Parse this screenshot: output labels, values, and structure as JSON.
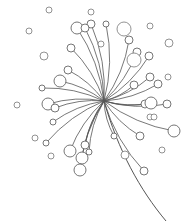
{
  "illustration": {
    "title": "Dandelion seed head line drawing",
    "stroke_color": "#555555",
    "background": "#ffffff",
    "center": [
      104,
      101
    ],
    "stem": {
      "path": "M104,101 C118,150 140,190 166,221"
    },
    "seeds": [
      [
        104,
        101,
        91,
        24,
        4
      ],
      [
        104,
        101,
        77,
        28,
        6
      ],
      [
        104,
        101,
        85,
        28,
        4
      ],
      [
        104,
        101,
        71,
        48,
        4
      ],
      [
        104,
        101,
        68,
        70,
        4
      ],
      [
        104,
        101,
        60,
        81,
        6
      ],
      [
        104,
        101,
        42,
        88,
        3
      ],
      [
        104,
        101,
        48,
        104,
        6
      ],
      [
        104,
        101,
        55,
        108,
        4
      ],
      [
        104,
        101,
        53,
        122,
        3
      ],
      [
        104,
        101,
        46,
        143,
        3
      ],
      [
        104,
        101,
        70,
        151,
        6
      ],
      [
        104,
        101,
        85,
        145,
        4
      ],
      [
        104,
        101,
        82,
        158,
        6
      ],
      [
        104,
        101,
        89,
        152,
        3
      ],
      [
        104,
        101,
        80,
        170,
        6
      ],
      [
        104,
        101,
        106,
        24,
        3
      ],
      [
        104,
        101,
        129,
        40,
        4
      ],
      [
        104,
        101,
        137,
        52,
        4
      ],
      [
        104,
        101,
        149,
        56,
        4
      ],
      [
        104,
        101,
        150,
        77,
        4
      ],
      [
        104,
        101,
        134,
        85,
        4
      ],
      [
        104,
        101,
        158,
        84,
        4
      ],
      [
        104,
        101,
        145,
        104,
        4
      ],
      [
        104,
        101,
        167,
        104,
        4
      ],
      [
        104,
        101,
        151,
        103,
        6
      ],
      [
        104,
        101,
        174,
        131,
        6
      ],
      [
        104,
        101,
        114,
        136,
        3
      ],
      [
        104,
        101,
        140,
        136,
        4
      ],
      [
        104,
        101,
        144,
        171,
        4
      ]
    ],
    "loose_dots": [
      [
        49,
        10,
        3
      ],
      [
        91,
        12,
        3
      ],
      [
        29,
        31,
        3
      ],
      [
        44,
        56,
        4
      ],
      [
        150,
        26,
        3
      ],
      [
        101,
        44,
        3
      ],
      [
        169,
        43,
        4
      ],
      [
        168,
        77,
        3
      ],
      [
        17,
        105,
        3
      ],
      [
        35,
        138,
        3
      ],
      [
        51,
        156,
        3
      ],
      [
        150,
        117,
        3
      ],
      [
        125,
        155,
        4
      ],
      [
        162,
        150,
        3
      ],
      [
        154,
        117,
        3
      ]
    ],
    "extra_bulbs": [
      [
        124,
        29,
        7
      ],
      [
        134,
        60,
        7
      ]
    ]
  }
}
